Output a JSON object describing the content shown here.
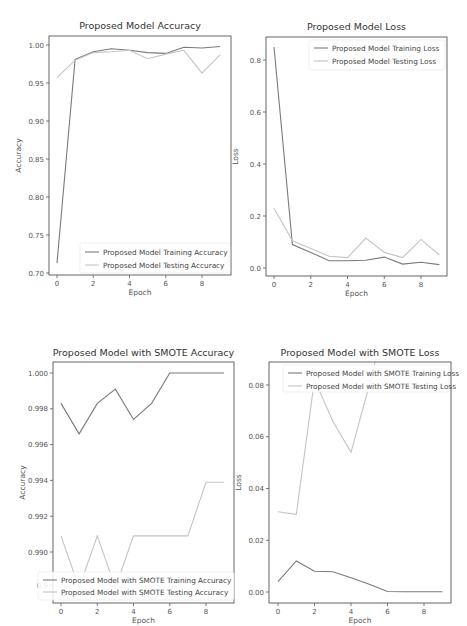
{
  "chart_data": [
    {
      "type": "line",
      "title": "Proposed Model Accuracy",
      "xlabel": "Epoch",
      "ylabel": "Accuracy",
      "x": [
        0,
        1,
        2,
        3,
        4,
        5,
        6,
        7,
        8,
        9
      ],
      "xticks": [
        "0",
        "2",
        "4",
        "6",
        "8"
      ],
      "yticks": [
        "0.70",
        "0.75",
        "0.80",
        "0.85",
        "0.90",
        "0.95",
        "1.00"
      ],
      "ylim": [
        0.7,
        1.005
      ],
      "legend_position": "lower right",
      "series": [
        {
          "name": "Proposed Model Training Accuracy",
          "color": "#7a7a7a",
          "values": [
            0.713,
            0.981,
            0.991,
            0.995,
            0.993,
            0.99,
            0.989,
            0.997,
            0.996,
            0.998
          ]
        },
        {
          "name": "Proposed Model Testing Accuracy",
          "color": "#c4c4c4",
          "values": [
            0.957,
            0.98,
            0.99,
            0.991,
            0.993,
            0.982,
            0.988,
            0.993,
            0.963,
            0.987
          ]
        }
      ],
      "grid": false
    },
    {
      "type": "line",
      "title": "Proposed Model Loss",
      "xlabel": "Epoch",
      "ylabel": "Loss",
      "x": [
        0,
        1,
        2,
        3,
        4,
        5,
        6,
        7,
        8,
        9
      ],
      "xticks": [
        "0",
        "2",
        "4",
        "6",
        "8"
      ],
      "yticks": [
        "0.0",
        "0.2",
        "0.4",
        "0.6",
        "0.8"
      ],
      "ylim": [
        -0.03,
        0.88
      ],
      "legend_position": "upper right",
      "series": [
        {
          "name": "Proposed Model Training Loss",
          "color": "#7a7a7a",
          "values": [
            0.85,
            0.09,
            0.06,
            0.028,
            0.028,
            0.03,
            0.042,
            0.015,
            0.022,
            0.013
          ]
        },
        {
          "name": "Proposed Model Testing Loss",
          "color": "#c4c4c4",
          "values": [
            0.23,
            0.105,
            0.075,
            0.045,
            0.04,
            0.115,
            0.06,
            0.04,
            0.11,
            0.05
          ]
        }
      ],
      "grid": false
    },
    {
      "type": "line",
      "title": "Proposed Model with SMOTE Accuracy",
      "xlabel": "Epoch",
      "ylabel": "Accuracy",
      "x": [
        0,
        1,
        2,
        3,
        4,
        5,
        6,
        7,
        8,
        9
      ],
      "xticks": [
        "0",
        "2",
        "4",
        "6",
        "8"
      ],
      "yticks": [
        "0.9",
        "0.990",
        "0.992",
        "0.994",
        "0.996",
        "0.998",
        "1.000"
      ],
      "ylim": [
        0.9876,
        1.0006
      ],
      "legend_position": "lower center (overlaps y tick labels)",
      "series": [
        {
          "name": "Proposed Model with SMOTE Training Accuracy",
          "color": "#7a7a7a",
          "values": [
            0.9983,
            0.9966,
            0.9983,
            0.9991,
            0.9974,
            0.9983,
            1.0,
            1.0,
            1.0,
            1.0
          ]
        },
        {
          "name": "Proposed Model with SMOTE Testing Accuracy",
          "color": "#c4c4c4",
          "values": [
            0.9909,
            0.988,
            0.9909,
            0.988,
            0.9909,
            0.9909,
            0.9909,
            0.9909,
            0.9939,
            0.9939
          ]
        }
      ],
      "grid": false
    },
    {
      "type": "line",
      "title": "Proposed Model with SMOTE Loss",
      "xlabel": "Epoch",
      "ylabel": "Loss",
      "x": [
        0,
        1,
        2,
        3,
        4,
        5,
        6,
        7,
        8,
        9
      ],
      "xticks": [
        "0",
        "2",
        "4",
        "6",
        "8"
      ],
      "yticks": [
        "0.00",
        "0.02",
        "0.04",
        "0.06",
        "0.08"
      ],
      "ylim": [
        -0.004,
        0.088
      ],
      "legend_position": "upper right (covers plot)",
      "series": [
        {
          "name": "Proposed Model with SMOTE Training Loss",
          "color": "#7a7a7a",
          "values": [
            0.004,
            0.012,
            0.008,
            0.0078,
            0.0055,
            0.003,
            0.0002,
            0.0001,
            0.0001,
            0.0001
          ]
        },
        {
          "name": "Proposed Model with SMOTE Testing Loss",
          "color": "#c4c4c4",
          "values": [
            0.031,
            0.03,
            0.082,
            0.066,
            0.054,
            0.08,
            null,
            null,
            null,
            null
          ]
        }
      ],
      "grid": false
    }
  ]
}
